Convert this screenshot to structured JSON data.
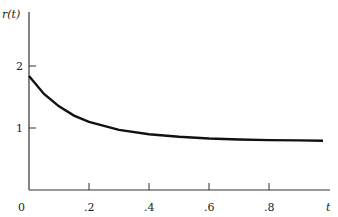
{
  "chart_data": {
    "type": "line",
    "title": "",
    "xlabel": "t",
    "ylabel": "r(t)",
    "x_ticks": [
      ".2",
      ".4",
      ".6",
      ".8"
    ],
    "y_ticks": [
      "1",
      "2"
    ],
    "origin_label": "0",
    "xlim": [
      0,
      1
    ],
    "ylim": [
      0,
      2.5
    ],
    "grid": false,
    "series": [
      {
        "name": "r(t)",
        "x": [
          0,
          0.05,
          0.1,
          0.15,
          0.2,
          0.3,
          0.4,
          0.5,
          0.6,
          0.7,
          0.8,
          0.9,
          0.98
        ],
        "values": [
          1.84,
          1.55,
          1.35,
          1.2,
          1.1,
          0.97,
          0.9,
          0.86,
          0.83,
          0.815,
          0.805,
          0.8,
          0.795
        ]
      }
    ]
  }
}
